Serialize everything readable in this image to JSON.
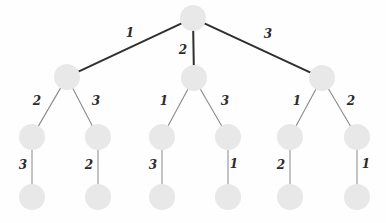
{
  "figure": {
    "name": "weighted-ternary-tree-diagram",
    "width": 386,
    "height": 223,
    "background_color": "#fefefe"
  },
  "style": {
    "node_fill": "#e8e8e8",
    "node_radius": 13,
    "edge_color_level1": "#2f2f2f",
    "edge_color_other": "#8a8a8a",
    "edge_width_level1": 2.0,
    "edge_width_level2": 1.1,
    "edge_width_level3": 1.0,
    "label_color": "#2b2b2b",
    "label_font_size": 12
  },
  "chart_data": {
    "type": "diagram",
    "title": "",
    "levels": 4,
    "node_count": 13,
    "edge_count": 12,
    "nodes": [
      {
        "id": "root",
        "label": "",
        "level": 0,
        "x": 193,
        "y": 18
      },
      {
        "id": "a",
        "label": "",
        "level": 1,
        "x": 67,
        "y": 77
      },
      {
        "id": "b",
        "label": "",
        "level": 1,
        "x": 194,
        "y": 78
      },
      {
        "id": "c",
        "label": "",
        "level": 1,
        "x": 322,
        "y": 78
      },
      {
        "id": "a1",
        "label": "",
        "level": 2,
        "x": 32,
        "y": 137
      },
      {
        "id": "a2",
        "label": "",
        "level": 2,
        "x": 98,
        "y": 137
      },
      {
        "id": "b1",
        "label": "",
        "level": 2,
        "x": 162,
        "y": 137
      },
      {
        "id": "b2",
        "label": "",
        "level": 2,
        "x": 228,
        "y": 137
      },
      {
        "id": "c1",
        "label": "",
        "level": 2,
        "x": 290,
        "y": 137
      },
      {
        "id": "c2",
        "label": "",
        "level": 2,
        "x": 357,
        "y": 137
      },
      {
        "id": "a1a",
        "label": "",
        "level": 3,
        "x": 32,
        "y": 197
      },
      {
        "id": "a2a",
        "label": "",
        "level": 3,
        "x": 98,
        "y": 197
      },
      {
        "id": "b1a",
        "label": "",
        "level": 3,
        "x": 162,
        "y": 197
      },
      {
        "id": "b2a",
        "label": "",
        "level": 3,
        "x": 228,
        "y": 197
      },
      {
        "id": "c1a",
        "label": "",
        "level": 3,
        "x": 290,
        "y": 197
      },
      {
        "id": "c2a",
        "label": "",
        "level": 3,
        "x": 357,
        "y": 197
      }
    ],
    "edges": [
      {
        "from": "root",
        "to": "a",
        "weight": "1",
        "level": 1,
        "label_x": 130,
        "label_y": 33
      },
      {
        "from": "root",
        "to": "b",
        "weight": "2",
        "level": 1,
        "label_x": 183,
        "label_y": 50
      },
      {
        "from": "root",
        "to": "c",
        "weight": "3",
        "level": 1,
        "label_x": 268,
        "label_y": 34
      },
      {
        "from": "a",
        "to": "a1",
        "weight": "2",
        "level": 2,
        "label_x": 37,
        "label_y": 101
      },
      {
        "from": "a",
        "to": "a2",
        "weight": "3",
        "level": 2,
        "label_x": 96,
        "label_y": 101
      },
      {
        "from": "b",
        "to": "b1",
        "weight": "1",
        "level": 2,
        "label_x": 164,
        "label_y": 101
      },
      {
        "from": "b",
        "to": "b2",
        "weight": "3",
        "level": 2,
        "label_x": 225,
        "label_y": 101
      },
      {
        "from": "c",
        "to": "c1",
        "weight": "1",
        "level": 2,
        "label_x": 297,
        "label_y": 101
      },
      {
        "from": "c",
        "to": "c2",
        "weight": "2",
        "level": 2,
        "label_x": 351,
        "label_y": 101
      },
      {
        "from": "a1",
        "to": "a1a",
        "weight": "3",
        "level": 3,
        "label_x": 23,
        "label_y": 165
      },
      {
        "from": "a2",
        "to": "a2a",
        "weight": "2",
        "level": 3,
        "label_x": 89,
        "label_y": 165
      },
      {
        "from": "b1",
        "to": "b1a",
        "weight": "3",
        "level": 3,
        "label_x": 153,
        "label_y": 165
      },
      {
        "from": "b2",
        "to": "b2a",
        "weight": "1",
        "level": 3,
        "label_x": 234,
        "label_y": 164
      },
      {
        "from": "c1",
        "to": "c1a",
        "weight": "2",
        "level": 3,
        "label_x": 281,
        "label_y": 165
      },
      {
        "from": "c2",
        "to": "c2a",
        "weight": "1",
        "level": 3,
        "label_x": 366,
        "label_y": 164
      }
    ]
  }
}
